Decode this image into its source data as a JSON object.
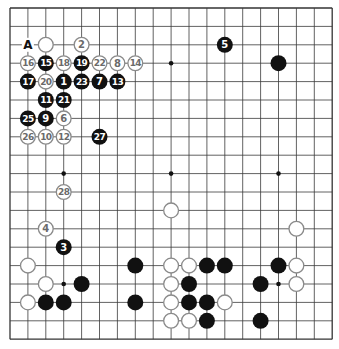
{
  "board": {
    "size": 19,
    "origin_x": 10,
    "origin_y": 8,
    "step_x": 17.9,
    "step_y": 18.4,
    "line_color": "#3a3a3a",
    "border_color": "#333333",
    "black_color": "#111111",
    "white_fill": "#ffffff",
    "white_stroke": "#8a8a8a",
    "white_text_color": "#6a6a6a",
    "black_text_color": "#ffffff",
    "star_points": [
      [
        3,
        3
      ],
      [
        9,
        3
      ],
      [
        15,
        3
      ],
      [
        3,
        9
      ],
      [
        9,
        9
      ],
      [
        15,
        9
      ],
      [
        3,
        15
      ],
      [
        9,
        15
      ],
      [
        15,
        15
      ]
    ]
  },
  "labels": [
    {
      "text": "A",
      "col": 1,
      "row": 2
    }
  ],
  "stones": {
    "black_numbered": [
      {
        "n": "1",
        "col": 3,
        "row": 4
      },
      {
        "n": "3",
        "col": 3,
        "row": 13
      },
      {
        "n": "5",
        "col": 12,
        "row": 2
      },
      {
        "n": "7",
        "col": 5,
        "row": 4
      },
      {
        "n": "9",
        "col": 2,
        "row": 6
      },
      {
        "n": "11",
        "col": 2,
        "row": 5
      },
      {
        "n": "13",
        "col": 6,
        "row": 4
      },
      {
        "n": "15",
        "col": 2,
        "row": 3
      },
      {
        "n": "17",
        "col": 1,
        "row": 4
      },
      {
        "n": "19",
        "col": 4,
        "row": 3
      },
      {
        "n": "21",
        "col": 3,
        "row": 5
      },
      {
        "n": "23",
        "col": 4,
        "row": 4
      },
      {
        "n": "25",
        "col": 1,
        "row": 6
      },
      {
        "n": "27",
        "col": 5,
        "row": 7
      }
    ],
    "white_numbered": [
      {
        "n": "2",
        "col": 4,
        "row": 2
      },
      {
        "n": "4",
        "col": 2,
        "row": 12
      },
      {
        "n": "6",
        "col": 3,
        "row": 6
      },
      {
        "n": "8",
        "col": 6,
        "row": 3
      },
      {
        "n": "10",
        "col": 2,
        "row": 7
      },
      {
        "n": "12",
        "col": 3,
        "row": 7
      },
      {
        "n": "14",
        "col": 7,
        "row": 3
      },
      {
        "n": "16",
        "col": 1,
        "row": 3
      },
      {
        "n": "18",
        "col": 3,
        "row": 3
      },
      {
        "n": "20",
        "col": 2,
        "row": 4
      },
      {
        "n": "22",
        "col": 5,
        "row": 3
      },
      {
        "n": "26",
        "col": 1,
        "row": 7
      },
      {
        "n": "28",
        "col": 3,
        "row": 10
      }
    ],
    "white_plain": [
      [
        2,
        2
      ],
      [
        9,
        11
      ],
      [
        16,
        12
      ],
      [
        1,
        14
      ],
      [
        9,
        14
      ],
      [
        10,
        14
      ],
      [
        16,
        14
      ],
      [
        2,
        15
      ],
      [
        9,
        15
      ],
      [
        16,
        15
      ],
      [
        1,
        16
      ],
      [
        9,
        16
      ],
      [
        12,
        16
      ],
      [
        9,
        17
      ],
      [
        10,
        17
      ]
    ],
    "black_plain": [
      [
        15,
        3
      ],
      [
        7,
        14
      ],
      [
        11,
        14
      ],
      [
        12,
        14
      ],
      [
        15,
        14
      ],
      [
        4,
        15
      ],
      [
        10,
        15
      ],
      [
        14,
        15
      ],
      [
        2,
        16
      ],
      [
        3,
        16
      ],
      [
        7,
        16
      ],
      [
        10,
        16
      ],
      [
        11,
        16
      ],
      [
        11,
        17
      ],
      [
        14,
        17
      ]
    ]
  }
}
